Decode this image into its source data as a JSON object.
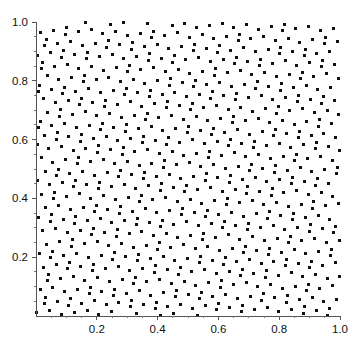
{
  "chart_data": {
    "type": "scatter",
    "title": "",
    "subtitle": "",
    "xlabel": "",
    "ylabel": "",
    "xlim": [
      0.0,
      1.0
    ],
    "ylim": [
      0.0,
      1.0
    ],
    "grid": false,
    "legend": null,
    "legend_position": "none",
    "annotations": [],
    "marker": {
      "shape": "square",
      "color": "#111111",
      "size_px": 3
    },
    "axis_color": "#555555",
    "background_color": "#ffffff",
    "xticks": [
      0.2,
      0.4,
      0.6,
      0.8,
      1.0
    ],
    "xtick_labels": [
      "0.2",
      "0.4",
      "0.6",
      "0.8",
      "1.0"
    ],
    "yticks": [
      0.2,
      0.4,
      0.6,
      0.8,
      1.0
    ],
    "ytick_labels": [
      "0.2",
      "0.4",
      "0.6",
      "0.8",
      "1.0"
    ],
    "x_minor_ticks": [
      0.05,
      0.1,
      0.15,
      0.25,
      0.3,
      0.35,
      0.45,
      0.5,
      0.55,
      0.65,
      0.7,
      0.75,
      0.85,
      0.9,
      0.95
    ],
    "y_minor_ticks": [
      0.05,
      0.1,
      0.15,
      0.25,
      0.3,
      0.35,
      0.45,
      0.5,
      0.55,
      0.65,
      0.7,
      0.75,
      0.85,
      0.9,
      0.95
    ],
    "n_points": 760,
    "series": [
      {
        "name": "quasi-random points",
        "generator": "kronecker-lattice",
        "alpha_x": 0.7548776662466927,
        "alpha_y": 0.5698402909980532,
        "seed_offset": 0.5,
        "color": "#111111"
      }
    ]
  },
  "figure": {
    "width_px": 353,
    "height_px": 350,
    "plot_left_px": 36,
    "plot_right_px": 340,
    "plot_top_px": 22,
    "plot_bottom_px": 316,
    "tick_length_px": 4,
    "minor_tick_length_px": 2
  }
}
